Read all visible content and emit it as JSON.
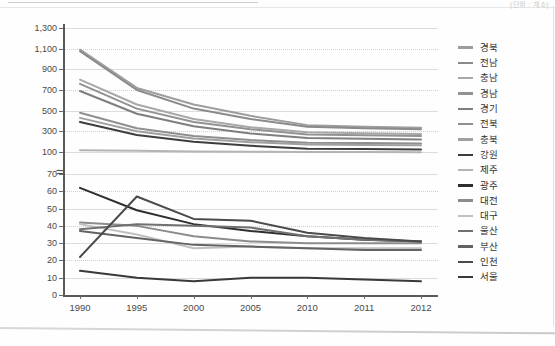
{
  "unit_label": "(단위 : 개소)",
  "chart_data": {
    "type": "line",
    "title": "",
    "xlabel": "",
    "ylabel": "",
    "grid": true,
    "legend_position": "right",
    "axis_break": true,
    "categories": [
      "1990",
      "1995",
      "2000",
      "2005",
      "2010",
      "2011",
      "2012"
    ],
    "upper_axis": {
      "ticks": [
        100,
        300,
        500,
        700,
        900,
        1100,
        1300
      ],
      "tick_labels": [
        "100",
        "300",
        "500",
        "700",
        "900",
        "1,100",
        "1,300"
      ],
      "ylim": [
        100,
        1300
      ]
    },
    "lower_axis": {
      "ticks": [
        0,
        10,
        20,
        30,
        40,
        50,
        60,
        70
      ],
      "tick_labels": [
        "0",
        "10",
        "20",
        "30",
        "40",
        "50",
        "60",
        "70"
      ],
      "ylim": [
        0,
        70
      ]
    },
    "series": [
      {
        "name": "경북",
        "color": "#9d9d9d",
        "panel": "upper",
        "values": [
          1090,
          720,
          560,
          450,
          360,
          345,
          335
        ]
      },
      {
        "name": "전남",
        "color": "#8a8a8a",
        "panel": "upper",
        "values": [
          1075,
          700,
          520,
          420,
          345,
          330,
          320
        ]
      },
      {
        "name": "충남",
        "color": "#a8a8a8",
        "panel": "upper",
        "values": [
          800,
          560,
          420,
          340,
          290,
          282,
          275
        ]
      },
      {
        "name": "경남",
        "color": "#929292",
        "panel": "upper",
        "values": [
          760,
          520,
          390,
          320,
          270,
          262,
          255
        ]
      },
      {
        "name": "경기",
        "color": "#7e7e7e",
        "panel": "upper",
        "values": [
          690,
          470,
          350,
          280,
          235,
          228,
          222
        ]
      },
      {
        "name": "전북",
        "color": "#8f8f8f",
        "panel": "upper",
        "values": [
          480,
          330,
          255,
          215,
          190,
          186,
          182
        ]
      },
      {
        "name": "충북",
        "color": "#a0a0a0",
        "panel": "upper",
        "values": [
          430,
          300,
          230,
          195,
          172,
          168,
          165
        ]
      },
      {
        "name": "강원",
        "color": "#3d3d3d",
        "panel": "upper",
        "values": [
          390,
          265,
          200,
          160,
          132,
          128,
          125
        ]
      },
      {
        "name": "제주",
        "color": "#b4b4b4",
        "panel": "upper",
        "values": [
          118,
          112,
          106,
          102,
          100,
          99,
          98
        ]
      },
      {
        "name": "광주",
        "color": "#2e2e2e",
        "panel": "lower",
        "values": [
          62,
          49,
          41,
          37,
          34,
          32,
          31
        ]
      },
      {
        "name": "대전",
        "color": "#8c8c8c",
        "panel": "lower",
        "values": [
          42,
          40,
          34,
          31,
          30,
          30,
          30
        ]
      },
      {
        "name": "대구",
        "color": "#c0c0c0",
        "panel": "lower",
        "values": [
          41,
          35,
          27,
          28,
          27,
          27,
          27
        ]
      },
      {
        "name": "울산",
        "color": "#707070",
        "panel": "lower",
        "values": [
          38,
          41,
          40,
          39,
          34,
          32,
          31
        ]
      },
      {
        "name": "부산",
        "color": "#636363",
        "panel": "lower",
        "values": [
          37,
          33,
          29,
          28,
          27,
          26,
          26
        ]
      },
      {
        "name": "인천",
        "color": "#4a4a4a",
        "panel": "lower",
        "values": [
          22,
          57,
          44,
          43,
          36,
          33,
          31
        ]
      },
      {
        "name": "서울",
        "color": "#393939",
        "panel": "lower",
        "values": [
          14,
          10,
          8,
          10,
          10,
          9,
          8
        ]
      }
    ]
  }
}
